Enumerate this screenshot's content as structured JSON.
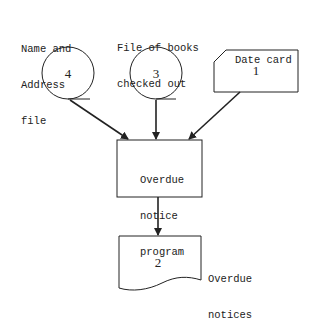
{
  "diagram": {
    "type": "flowchart",
    "nodes": [
      {
        "id": "4",
        "shape": "magnetic-tape",
        "number": "4",
        "label_lines": [
          "Name and",
          "Address",
          "file"
        ]
      },
      {
        "id": "3",
        "shape": "magnetic-tape",
        "number": "3",
        "label_lines": [
          "File of books",
          "checked out"
        ]
      },
      {
        "id": "1",
        "shape": "punched-card",
        "number": "1",
        "label_lines": [
          "Date card"
        ]
      },
      {
        "id": "program",
        "shape": "process",
        "label_lines": [
          "Overdue",
          "notice",
          "program"
        ]
      },
      {
        "id": "2",
        "shape": "document",
        "number": "2",
        "label_lines": [
          "Overdue",
          "notices"
        ]
      }
    ],
    "edges": [
      {
        "from": "4",
        "to": "program"
      },
      {
        "from": "3",
        "to": "program"
      },
      {
        "from": "1",
        "to": "program"
      },
      {
        "from": "program",
        "to": "2"
      }
    ],
    "colors": {
      "stroke": "#222222",
      "background": "#ffffff"
    }
  }
}
